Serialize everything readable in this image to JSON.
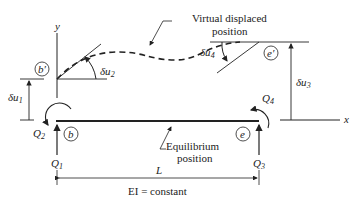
{
  "diagram": {
    "type": "beam-virtual-displacement",
    "labels": {
      "y_axis": "y",
      "x_axis": "x",
      "virtual_displaced_position": [
        "Virtual displaced",
        "position"
      ],
      "equilibrium_position": [
        "Equilibrium",
        "position"
      ],
      "length": "L",
      "ei": "EI = constant"
    },
    "nodes": {
      "b_prime": "b′",
      "e_prime": "e′",
      "b": "b",
      "e": "e"
    },
    "displacements": {
      "du1": "δu",
      "du1_sub": "1",
      "du2": "δu",
      "du2_sub": "2",
      "du3": "δu",
      "du3_sub": "3",
      "du4": "δu",
      "du4_sub": "4"
    },
    "forces": {
      "Q1": "Q",
      "Q1_sub": "1",
      "Q2": "Q",
      "Q2_sub": "2",
      "Q3": "Q",
      "Q3_sub": "3",
      "Q4": "Q",
      "Q4_sub": "4"
    },
    "colors": {
      "line": "#222222",
      "background": "#ffffff"
    }
  }
}
